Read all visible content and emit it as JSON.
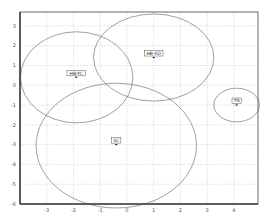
{
  "chart_data": {
    "type": "scatter",
    "title": "",
    "xlabel": "",
    "ylabel": "",
    "xlim": [
      -4.0,
      4.9
    ],
    "ylim": [
      -6.0,
      3.7
    ],
    "grid": true,
    "legend": null,
    "x_ticks": [
      -3,
      -2,
      -1,
      0,
      1,
      2,
      3,
      4
    ],
    "y_ticks": [
      3,
      2,
      1,
      0,
      -1,
      -2,
      -3,
      -4,
      -5,
      -6
    ],
    "points": [
      {
        "label": "HB-YC",
        "x": -1.9,
        "y": 0.4
      },
      {
        "label": "HB-XD",
        "x": 1.0,
        "y": 1.4
      },
      {
        "label": "SC",
        "x": -0.4,
        "y": -3.0
      },
      {
        "label": "YN",
        "x": 4.1,
        "y": -1.0
      }
    ],
    "ellipses": [
      {
        "label": "HB-YC",
        "cx": -1.88,
        "cy": 0.4,
        "rx": 2.1,
        "ry": 2.3
      },
      {
        "label": "HB-XD",
        "cx": 1.0,
        "cy": 1.4,
        "rx": 2.25,
        "ry": 2.2
      },
      {
        "label": "SC",
        "cx": -0.4,
        "cy": -3.05,
        "rx": 3.0,
        "ry": 3.15
      },
      {
        "label": "YN",
        "cx": 4.1,
        "cy": -1.0,
        "rx": 0.85,
        "ry": 0.85
      }
    ]
  },
  "colors": {
    "frame": "#444444",
    "grid": "#c8c8c8",
    "ellipse": "#777777",
    "marker": "#111111"
  }
}
